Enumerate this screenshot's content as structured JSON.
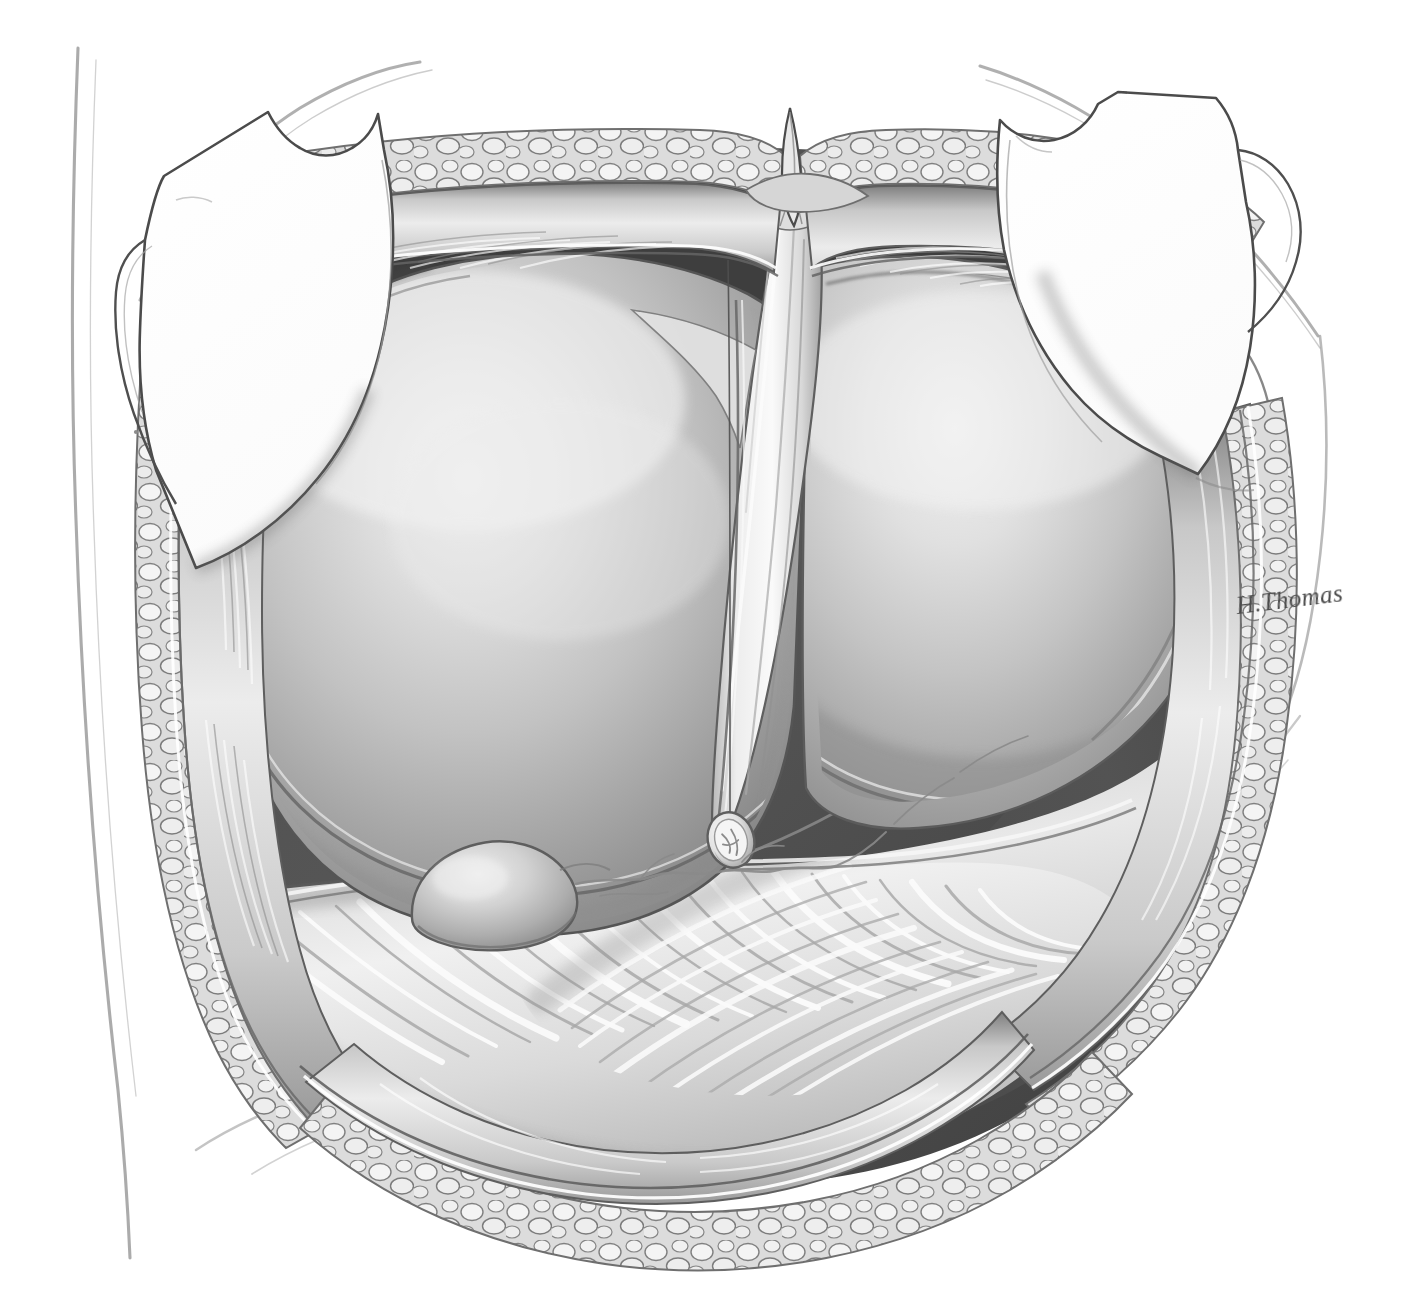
{
  "illustration": {
    "title": "Upper midline laparotomy exposure of the liver and greater omentum",
    "medium": "grayscale airbrush / pen-and-ink medical illustration",
    "background_color": "#ffffff",
    "signature": "H.Thomas",
    "signature_position": {
      "x": 1238,
      "y": 592
    },
    "canvas": {
      "width": 1405,
      "height": 1312
    }
  },
  "palette": {
    "background": "#ffffff",
    "outline": "#3a3a3a",
    "faint_sketch_line": "#9a9a9a",
    "retractor_blade_fill": "#ffffff",
    "retractor_blade_stroke": "#4b4b4b",
    "cavity_shadow_dark": "#4d4d4d",
    "cavity_shadow_darkest": "#3c3c3c",
    "liver_light": "#e9e9e9",
    "liver_mid": "#bdbdbd",
    "liver_dark": "#8e8e8e",
    "liver_edge_shadow": "#6f6f6f",
    "falciform_light": "#f2f2f2",
    "falciform_mid": "#d2d2d2",
    "omentum_light": "#f0f0f0",
    "omentum_mid": "#c6c6c6",
    "omentum_dark": "#9b9b9b",
    "fat_lobule_light": "#f4f4f4",
    "fat_lobule_mid": "#c9c9c9",
    "fat_lobule_stroke": "#717171",
    "fascia_light": "#e4e4e4",
    "fascia_mid": "#b3b3b3",
    "peritoneum_line": "#6a6a6a",
    "gallbladder_light": "#dcdcdc",
    "gallbladder_mid": "#ababab",
    "vessel_line": "#8a8a8a",
    "ligature_stump": "#e0e0e0"
  },
  "anatomy": {
    "structures": [
      {
        "id": "body-contour-left",
        "label": "Body contour sketch line (left flank)",
        "interactable": false
      },
      {
        "id": "body-contour-right",
        "label": "Body contour sketch line (right flank)",
        "interactable": false
      },
      {
        "id": "costal-margin-left",
        "label": "Left costal margin guide line",
        "interactable": false
      },
      {
        "id": "costal-margin-right",
        "label": "Right costal margin guide line",
        "interactable": false
      },
      {
        "id": "retractor-blade-left",
        "label": "Self-retaining retractor blade (left)",
        "interactable": true
      },
      {
        "id": "retractor-blade-right",
        "label": "Self-retaining retractor blade (right)",
        "interactable": true
      },
      {
        "id": "wound-edge-upper",
        "label": "Upper abdominal wound edge",
        "interactable": false
      },
      {
        "id": "subcutaneous-fat",
        "label": "Subcutaneous fat lobules at wound margin",
        "interactable": false
      },
      {
        "id": "rectus-fascia",
        "label": "Anterior rectus sheath / fascia",
        "interactable": false
      },
      {
        "id": "peritoneum",
        "label": "Cut edge of parietal peritoneum",
        "interactable": false
      },
      {
        "id": "xiphoid-apex",
        "label": "Xiphoid apex of the midline incision",
        "interactable": false
      },
      {
        "id": "cavity-shadow",
        "label": "Peritoneal cavity shadow",
        "interactable": false
      },
      {
        "id": "liver-left-lobe",
        "label": "Left lobe of the liver",
        "interactable": false
      },
      {
        "id": "liver-right-lobe",
        "label": "Right lobe of the liver",
        "interactable": false
      },
      {
        "id": "falciform-ligament",
        "label": "Falciform ligament",
        "interactable": false
      },
      {
        "id": "ligamentum-teres",
        "label": "Divided ligamentum teres (round ligament) stump",
        "interactable": false
      },
      {
        "id": "gallbladder-fundus",
        "label": "Fundus of the gallbladder",
        "interactable": false
      },
      {
        "id": "greater-omentum",
        "label": "Greater omentum",
        "interactable": false
      },
      {
        "id": "omental-vessels",
        "label": "Omental / subserosal vessels",
        "interactable": false
      },
      {
        "id": "transverse-colon",
        "label": "Haustrated transverse colon beneath omentum",
        "interactable": false
      }
    ]
  }
}
